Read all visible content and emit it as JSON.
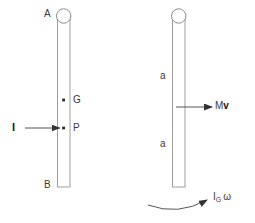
{
  "diagram": {
    "colors": {
      "rod_stroke": "#9a9a9a",
      "rod_fill": "#ffffff",
      "arrow": "#404040",
      "text": "#3a3a3a",
      "text_bold": "#1a1a1a",
      "background": "#ffffff"
    },
    "left_figure": {
      "name": "rod-with-impulse",
      "top_label": "A",
      "bottom_label": "B",
      "center_of_mass_label": "G",
      "impact_point_label": "P",
      "impulse_label": "I",
      "pivot_shape": "circle"
    },
    "right_figure": {
      "name": "rod-with-momentum",
      "upper_distance_label": "a",
      "lower_distance_label": "a",
      "linear_momentum_label_m": "M",
      "linear_momentum_label_v": "v",
      "angular_momentum_label_i": "I",
      "angular_momentum_sub_g": "G",
      "angular_momentum_omega": "ω",
      "pivot_shape": "circle"
    }
  }
}
